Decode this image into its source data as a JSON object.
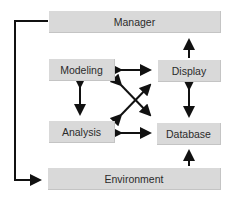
{
  "diagram": {
    "nodes": {
      "manager": {
        "label": "Manager"
      },
      "modeling": {
        "label": "Modeling"
      },
      "display": {
        "label": "Display"
      },
      "analysis": {
        "label": "Analysis"
      },
      "database": {
        "label": "Database"
      },
      "environment": {
        "label": "Environment"
      }
    },
    "edges": [
      {
        "from": "display",
        "to": "manager",
        "direction": "one-way"
      },
      {
        "from": "modeling",
        "to": "display",
        "direction": "two-way"
      },
      {
        "from": "modeling",
        "to": "analysis",
        "direction": "two-way"
      },
      {
        "from": "display",
        "to": "database",
        "direction": "two-way"
      },
      {
        "from": "analysis",
        "to": "database",
        "direction": "two-way"
      },
      {
        "from": "modeling",
        "to": "database",
        "direction": "two-way"
      },
      {
        "from": "analysis",
        "to": "display",
        "direction": "two-way"
      },
      {
        "from": "environment",
        "to": "database",
        "direction": "one-way"
      },
      {
        "from": "manager",
        "to": "environment",
        "direction": "one-way"
      }
    ],
    "colors": {
      "box": "#d9d9d9",
      "line": "#111111",
      "text": "#2b2b2b"
    }
  }
}
